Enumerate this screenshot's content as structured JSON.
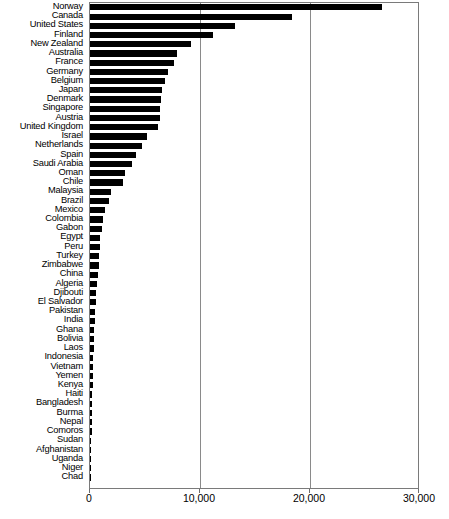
{
  "chart_data": {
    "type": "bar",
    "orientation": "horizontal",
    "title": "",
    "xlabel": "",
    "ylabel": "",
    "xlim": [
      0,
      30000
    ],
    "xticks": [
      0,
      10000,
      20000,
      30000
    ],
    "xtick_labels": [
      "0",
      "10,000",
      "20,000",
      "30,000"
    ],
    "grid": "vertical",
    "gridlines": [
      10000,
      20000
    ],
    "legend": "none",
    "bar_color": "#000000",
    "categories": [
      "Norway",
      "Canada",
      "United States",
      "Finland",
      "New Zealand",
      "Australia",
      "France",
      "Germany",
      "Belgium",
      "Japan",
      "Denmark",
      "Singapore",
      "Austria",
      "United Kingdom",
      "Israel",
      "Netherlands",
      "Spain",
      "Saudi Arabia",
      "Oman",
      "Chile",
      "Malaysia",
      "Brazil",
      "Mexico",
      "Colombia",
      "Gabon",
      "Egypt",
      "Peru",
      "Turkey",
      "Zimbabwe",
      "China",
      "Algeria",
      "Djibouti",
      "El Salvador",
      "Pakistan",
      "India",
      "Ghana",
      "Bolivia",
      "Laos",
      "Indonesia",
      "Vietnam",
      "Yemen",
      "Kenya",
      "Haiti",
      "Bangladesh",
      "Burma",
      "Nepal",
      "Comoros",
      "Sudan",
      "Afghanistan",
      "Uganda",
      "Niger",
      "Chad"
    ],
    "values": [
      26500,
      18400,
      13200,
      11200,
      9200,
      7900,
      7650,
      7100,
      6850,
      6550,
      6450,
      6400,
      6350,
      6200,
      5200,
      4700,
      4200,
      3800,
      3200,
      3000,
      1900,
      1750,
      1400,
      1200,
      1050,
      950,
      900,
      850,
      800,
      700,
      620,
      560,
      510,
      470,
      430,
      390,
      350,
      320,
      300,
      270,
      250,
      230,
      210,
      190,
      170,
      155,
      140,
      125,
      105,
      85,
      60,
      40
    ]
  },
  "axis": {
    "tick_labels": [
      "0",
      "10,000",
      "20,000",
      "30,000"
    ]
  }
}
